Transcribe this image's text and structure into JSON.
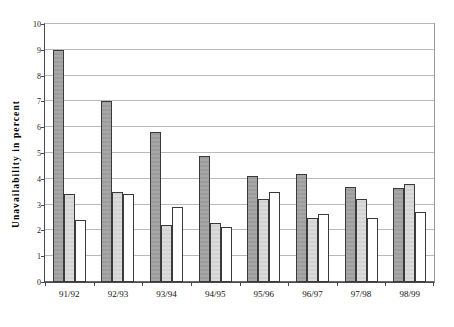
{
  "chart": {
    "ylabel": "Unavailability in percent",
    "xlabel": "",
    "title": ""
  },
  "chart_data": {
    "type": "bar",
    "title": "",
    "xlabel": "",
    "ylabel": "Unavailability in percent",
    "ylim": [
      0,
      10
    ],
    "yticks": [
      "0",
      "1",
      "2",
      "3",
      "4",
      "5",
      "6",
      "7",
      "8",
      "9",
      "10"
    ],
    "grid": true,
    "legend": "none",
    "categories": [
      "91/92",
      "92/93",
      "93/94",
      "94/95",
      "95/96",
      "96/97",
      "97/98",
      "98/99"
    ],
    "series": [
      {
        "name": "series-1",
        "color": "#a0a0a0",
        "values": [
          9.0,
          7.0,
          5.8,
          4.9,
          4.1,
          4.2,
          3.7,
          3.65
        ]
      },
      {
        "name": "series-2",
        "color": "#d8d8d8",
        "values": [
          3.4,
          3.5,
          2.2,
          2.3,
          3.2,
          2.5,
          3.2,
          3.8
        ]
      },
      {
        "name": "series-3",
        "color": "#ffffff",
        "values": [
          2.4,
          3.4,
          2.9,
          2.15,
          3.5,
          2.65,
          2.5,
          2.7
        ]
      }
    ]
  }
}
